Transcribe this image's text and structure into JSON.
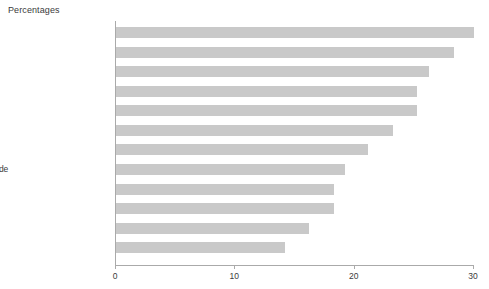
{
  "chart_data": {
    "type": "bar",
    "orientation": "horizontal",
    "title": "Percentages",
    "xlabel": "",
    "ylabel": "",
    "xlim": [
      0,
      30
    ],
    "xticks": [
      0,
      10,
      20,
      30
    ],
    "xtick_labels": [
      "0",
      "10",
      "20",
      "30"
    ],
    "grid": false,
    "legend": null,
    "bar_color": "#c9c9c9",
    "axis_color": "#aaaaaa",
    "text_color": "#3b3b3b",
    "categories": [
      "North West",
      "Greater London",
      "North",
      "Northern Ireland",
      "East Midlands",
      "Scotland",
      "West Midlands",
      "Yorkshire & Humberside",
      "Wales",
      "Rest of South East",
      "South West",
      "East Anglia"
    ],
    "values": [
      30.0,
      28.3,
      26.2,
      25.2,
      25.2,
      23.2,
      21.1,
      19.2,
      18.3,
      18.3,
      16.2,
      14.2
    ]
  }
}
